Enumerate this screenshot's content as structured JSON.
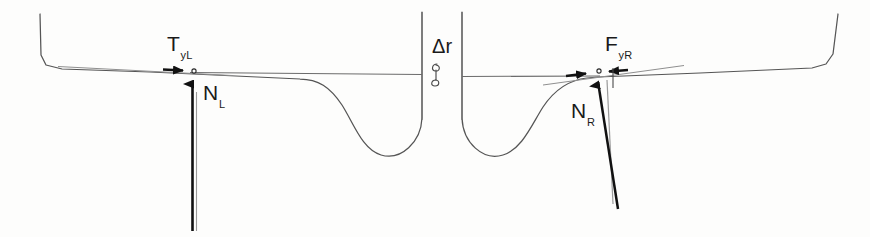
{
  "figure": {
    "background_color": "#fdfdfc",
    "line_color": "#3c3c3c",
    "heavy_line_color": "#1a1a1a",
    "light_line_color": "#8a8a8a",
    "width": 870,
    "height": 237
  },
  "labels": {
    "tangential_left": {
      "base": "T",
      "sub": "yL",
      "x": 167,
      "y": 33
    },
    "normal_left": {
      "base": "N",
      "sub": "L",
      "x": 203,
      "y": 82
    },
    "delta_r": {
      "base": "Δr",
      "sub": "",
      "x": 432,
      "y": 36
    },
    "force_right": {
      "base": "F",
      "sub": "yR",
      "x": 605,
      "y": 33
    },
    "normal_right": {
      "base": "N",
      "sub": "R",
      "x": 571,
      "y": 100
    }
  },
  "geometry": {
    "profile_outline": "M 40 14 L 41 55 L 46 65 L 62 69 L 300 79 C 318 79 332 88 344 106 C 356 126 364 150 382 155 C 402 160 421 140 422 118 L 422 12",
    "profile_outline_right": "M 462 12 L 462 118 C 463 142 482 160 502 156 C 520 152 530 128 542 108 C 554 90 568 80 586 78 L 598 77 L 812 68 L 826 64 L 833 54 L 838 14",
    "surface_line_left": "M 46 66 L 196 73",
    "surface_line_right": "M 598 73 L 825 66",
    "tangent_line_left": "M 58 67 L 230 75",
    "tangent_line_right": "M 543 84 L 680 66",
    "horizontal_reference": "M 190 73 L 600 76",
    "wall_left": "M 422 12 L 422 120",
    "wall_right": "M 462 12 L 462 120",
    "normal_left_arrow": {
      "x1": 192,
      "y1": 231,
      "x2": 192,
      "y2": 78
    },
    "normal_left_ghost": {
      "x1": 196,
      "y1": 231,
      "x2": 196,
      "y2": 90
    },
    "normal_right_arrow": {
      "x1": 617,
      "y1": 208,
      "x2": 597,
      "y2": 78
    },
    "normal_right_ghost": {
      "x1": 614,
      "y1": 200,
      "x2": 608,
      "y2": 80
    },
    "tangential_left_arrow": {
      "x1": 166,
      "y1": 69,
      "x2": 190,
      "y2": 71
    },
    "force_right_arrow_in": {
      "x1": 570,
      "y1": 77,
      "x2": 592,
      "y2": 73
    },
    "force_right_arrow_out": {
      "x1": 625,
      "y1": 70,
      "x2": 603,
      "y2": 72
    },
    "delta_r_marker": {
      "x": 436,
      "y": 73
    },
    "contact_point_left": {
      "x": 194,
      "y": 72
    },
    "contact_point_right": {
      "x": 598,
      "y": 72
    }
  }
}
